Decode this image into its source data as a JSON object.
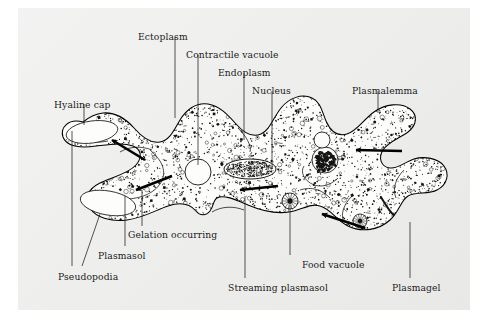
{
  "figure": {
    "background_color": "#ececeb",
    "ink_color": "#141414"
  },
  "labels": [
    {
      "id": "ectoplasm",
      "text": "Ectoplasm",
      "x": 138,
      "y": 32,
      "anchor": "start"
    },
    {
      "id": "contractile-vacuole",
      "text": "Contractile vacuole",
      "x": 186,
      "y": 50,
      "anchor": "start"
    },
    {
      "id": "endoplasm",
      "text": "Endoplasm",
      "x": 218,
      "y": 68,
      "anchor": "start"
    },
    {
      "id": "nucleus",
      "text": "Nucleus",
      "x": 252,
      "y": 86,
      "anchor": "start"
    },
    {
      "id": "plasmalemma",
      "text": "Plasmalemma",
      "x": 352,
      "y": 86,
      "anchor": "start"
    },
    {
      "id": "hyaline-cap",
      "text": "Hyaline cap",
      "x": 54,
      "y": 100,
      "anchor": "start"
    },
    {
      "id": "gelation-occurring",
      "text": "Gelation occurring",
      "x": 128,
      "y": 230,
      "anchor": "start"
    },
    {
      "id": "plasmasol",
      "text": "Plasmasol",
      "x": 98,
      "y": 251,
      "anchor": "start"
    },
    {
      "id": "pseudopodia",
      "text": "Pseudopodia",
      "x": 58,
      "y": 272,
      "anchor": "start"
    },
    {
      "id": "food-vacuole",
      "text": "Food vacuole",
      "x": 302,
      "y": 260,
      "anchor": "start"
    },
    {
      "id": "streaming-plasmasol",
      "text": "Streaming plasmasol",
      "x": 228,
      "y": 283,
      "anchor": "start"
    },
    {
      "id": "plasmagel",
      "text": "Plasmagel",
      "x": 392,
      "y": 283,
      "anchor": "start"
    }
  ],
  "leader_lines": [
    {
      "id": "leader-ectoplasm",
      "d": "M175,37 L175,118"
    },
    {
      "id": "leader-contractile-vacuole",
      "d": "M198,55 L198,165"
    },
    {
      "id": "leader-endoplasm",
      "d": "M244,73 L244,140"
    },
    {
      "id": "leader-nucleus",
      "d": "M272,91 L272,168"
    },
    {
      "id": "leader-plasmalemma",
      "d": "M378,91 L378,113"
    },
    {
      "id": "leader-hyaline-cap",
      "d": "M84,104 L84,125"
    },
    {
      "id": "leader-gelation",
      "d": "M142,226 L142,190"
    },
    {
      "id": "leader-plasmasol",
      "d": "M125,246 L125,196"
    },
    {
      "id": "leader-pseudopodia-a",
      "d": "M72,266 L72,131"
    },
    {
      "id": "leader-pseudopodia-b",
      "d": "M82,266 L100,214"
    },
    {
      "id": "leader-food-vacuole",
      "d": "M290,255 L290,205"
    },
    {
      "id": "leader-streaming-plasmasol",
      "d": "M245,278 L245,196"
    },
    {
      "id": "leader-plasmagel",
      "d": "M410,278 L410,222"
    }
  ],
  "cell": {
    "outline_path": "M83,122 C68,118 60,128 63,137 C67,147 82,148 96,146 C110,145 122,142 133,146 C141,149 143,157 136,165 C128,174 112,177 100,183 C88,189 84,198 90,208 C96,218 112,222 127,220 C143,218 156,210 168,206 C180,202 190,204 196,211 C200,216 206,216 210,211 C214,206 213,200 217,198 C224,194 236,200 248,205 C262,211 276,214 289,212 C302,210 310,203 320,206 C331,209 336,220 348,226 C362,233 379,230 390,220 C399,212 401,200 408,196 C416,191 428,195 437,190 C447,185 450,174 444,166 C438,158 424,156 414,159 C405,162 398,169 390,168 C381,167 378,158 383,150 C388,142 400,138 408,132 C417,125 418,115 410,109 C401,102 385,104 374,112 C363,120 357,131 347,134 C337,137 330,130 326,121 C322,112 321,102 312,98 C302,93 289,98 281,108 C273,118 270,130 261,134 C252,138 243,132 236,124 C228,115 220,106 208,104 C196,102 186,110 180,120 C174,130 170,140 160,142 C150,144 141,136 134,128 C126,119 115,112 103,113 C94,114 88,118 83,122 Z",
    "ecto_inner_path": "M88,128 C78,126 73,132 75,138 C78,144 89,145 99,143 C112,141 124,138 135,141",
    "hyaline_caps": [
      {
        "id": "hyaline-cap-upper",
        "cx": 92,
        "cy": 132,
        "rx": 26,
        "ry": 11,
        "rot": -8
      },
      {
        "id": "hyaline-cap-lower",
        "cx": 108,
        "cy": 203,
        "rx": 28,
        "ry": 12,
        "rot": 10
      }
    ],
    "contractile_vacuole": {
      "id": "contractile-vacuole-body",
      "cx": 198,
      "cy": 172,
      "r": 13
    },
    "nucleus": {
      "id": "nucleus-body",
      "cx": 250,
      "cy": 169,
      "rx": 26,
      "ry": 10
    },
    "food_vacuoles": [
      {
        "id": "food-vacuole-main",
        "cx": 290,
        "cy": 201,
        "r": 8
      },
      {
        "id": "food-vacuole-dark",
        "cx": 325,
        "cy": 160,
        "r": 13
      },
      {
        "id": "food-vacuole-small",
        "cx": 360,
        "cy": 221,
        "r": 7
      },
      {
        "id": "vacuole-clear",
        "cx": 322,
        "cy": 140,
        "r": 8
      }
    ],
    "stream_arrows": [
      {
        "id": "arrow-upper-left",
        "x1": 145,
        "y1": 160,
        "x2": 112,
        "y2": 140
      },
      {
        "id": "arrow-lower-left",
        "x1": 172,
        "y1": 176,
        "x2": 136,
        "y2": 190
      },
      {
        "id": "arrow-center",
        "x1": 278,
        "y1": 186,
        "x2": 240,
        "y2": 190
      },
      {
        "id": "arrow-right-upper",
        "x1": 402,
        "y1": 151,
        "x2": 356,
        "y2": 150
      },
      {
        "id": "arrow-right-lower",
        "x1": 365,
        "y1": 228,
        "x2": 322,
        "y2": 214
      }
    ]
  }
}
